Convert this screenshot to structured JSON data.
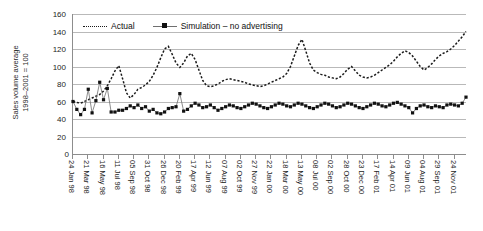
{
  "chart_data": {
    "type": "line",
    "title": "",
    "xlabel": "",
    "ylabel": "Sales volume average\n1998–2001 = 100",
    "ylabel_line1": "Sales volume average",
    "ylabel_line2": "1998–2001 = 100",
    "ylim": [
      0,
      160
    ],
    "ytick_values": [
      0,
      20,
      40,
      60,
      80,
      100,
      120,
      140,
      160
    ],
    "ytick_labels": [
      "0",
      "20",
      "40",
      "60",
      "80",
      "100",
      "120",
      "140",
      "160"
    ],
    "grid": true,
    "grid_axis": "y",
    "legend_position": "top-left-inside",
    "xtick_labels": [
      "24 Jan 98",
      "21 Mar 98",
      "16 May 98",
      "11 Jul 98",
      "05 Sep 98",
      "31 Oct 98",
      "26 Dec 98",
      "20 Feb 99",
      "17 Apr 99",
      "12 Jun 99",
      "07 Aug 99",
      "02 Oct 99",
      "27 Nov 99",
      "22 Jan 00",
      "18 Mar 00",
      "13 May 00",
      "08 Jul 00",
      "02 Sep 00",
      "28 Oct 00",
      "23 Dec 00",
      "17 Feb 01",
      "14 Apr 01",
      "09 Jun 01",
      "04 Aug 01",
      "29 Sep 01",
      "24 Nov 01"
    ],
    "xtick_every": 4,
    "n_points": 104,
    "series": [
      {
        "name": "Actual",
        "style": "dotted",
        "color": "#1a1a1a",
        "marker": "none",
        "values": [
          60,
          59,
          58,
          60,
          62,
          64,
          66,
          68,
          72,
          78,
          86,
          95,
          101,
          86,
          70,
          64,
          68,
          74,
          76,
          79,
          83,
          90,
          99,
          110,
          120,
          123,
          114,
          104,
          99,
          104,
          112,
          115,
          108,
          96,
          84,
          78,
          77,
          78,
          80,
          83,
          85,
          86,
          85,
          84,
          83,
          82,
          80,
          79,
          78,
          77,
          78,
          80,
          82,
          84,
          86,
          88,
          92,
          100,
          112,
          124,
          131,
          118,
          104,
          96,
          93,
          91,
          90,
          88,
          87,
          86,
          88,
          92,
          97,
          100,
          95,
          90,
          88,
          87,
          88,
          90,
          93,
          96,
          99,
          102,
          106,
          111,
          115,
          118,
          116,
          112,
          106,
          100,
          96,
          99,
          103,
          108,
          112,
          115,
          117,
          120,
          124,
          129,
          134,
          140
        ]
      },
      {
        "name": "Simulation – no advertising",
        "style": "solid",
        "color": "#6f6f6f",
        "marker": "square",
        "marker_color": "#111111",
        "values": [
          60,
          51,
          45,
          51,
          74,
          47,
          61,
          82,
          62,
          75,
          48,
          48,
          50,
          50,
          52,
          55,
          53,
          56,
          52,
          54,
          49,
          51,
          47,
          46,
          48,
          52,
          53,
          54,
          69,
          49,
          51,
          55,
          58,
          56,
          53,
          54,
          56,
          53,
          50,
          52,
          54,
          56,
          55,
          53,
          52,
          54,
          56,
          58,
          57,
          55,
          53,
          52,
          54,
          56,
          58,
          57,
          55,
          54,
          56,
          58,
          57,
          55,
          53,
          52,
          54,
          56,
          58,
          57,
          55,
          53,
          54,
          56,
          58,
          57,
          55,
          53,
          52,
          54,
          56,
          58,
          57,
          55,
          54,
          56,
          58,
          59,
          57,
          55,
          53,
          47,
          52,
          55,
          56,
          54,
          53,
          55,
          54,
          53,
          56,
          57,
          56,
          55,
          58,
          65
        ]
      }
    ]
  },
  "legend": {
    "entries": [
      {
        "label": "Actual"
      },
      {
        "label": "Simulation – no advertising"
      }
    ]
  },
  "zero_label": "0"
}
